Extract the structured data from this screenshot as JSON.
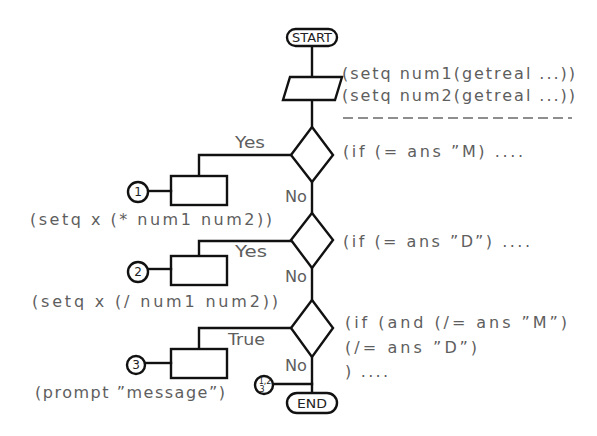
{
  "diagram": {
    "start_label": "START",
    "end_label": "END",
    "input_code": [
      "(setq num1(getreal ...))",
      "(setq num2(getreal ...))"
    ],
    "decisions": [
      {
        "condition": "(if (= ans ”M) ....",
        "branch_label": "Yes",
        "no_label": "No"
      },
      {
        "condition": "(if (= ans ”D”) ....",
        "branch_label": "Yes",
        "no_label": "No"
      },
      {
        "condition_lines": [
          "(if (and (/= ans ”M”)",
          "(/= ans ”D”)",
          ") ...."
        ],
        "branch_label": "True",
        "no_label": "No"
      }
    ],
    "processes": [
      {
        "connector": "1",
        "code": "(setq x (* num1 num2))"
      },
      {
        "connector": "2",
        "code": "(setq x (/ num1 num2))"
      },
      {
        "connector": "3",
        "code": "(prompt ”message”)"
      }
    ],
    "merge_connector": {
      "top": "1,2",
      "bottom": "3"
    },
    "colors": {
      "line": "#111111",
      "text": "#5e5e5e",
      "background": "#ffffff"
    }
  }
}
